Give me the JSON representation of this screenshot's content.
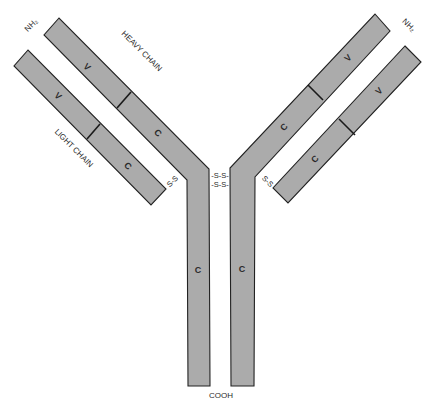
{
  "diagram": {
    "colors": {
      "fill": "#ababab",
      "stroke": "#222222",
      "background": "#ffffff"
    },
    "labels": {
      "heavy_chain": "HEAVY CHAIN",
      "light_chain": "LIGHT CHAIN",
      "n_terminus_left": "NH₂",
      "n_terminus_right": "NH₂",
      "c_terminus": "COOH"
    },
    "domains": {
      "left_heavy_variable": "V",
      "left_heavy_constant": "C",
      "left_light_variable": "V",
      "left_light_constant": "C",
      "right_heavy_variable": "V",
      "right_heavy_constant": "C",
      "right_light_variable": "V",
      "right_light_constant": "C",
      "left_stem_constant": "C",
      "right_stem_constant": "C"
    },
    "disulfide_bonds": {
      "left_light_heavy": "S-S",
      "right_light_heavy": "S-S",
      "hinge_top": "-S-S-",
      "hinge_bottom": "-S-S-"
    }
  }
}
